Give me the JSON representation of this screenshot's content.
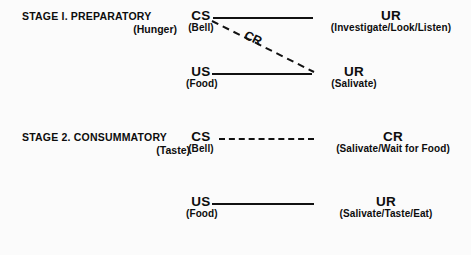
{
  "figure": {
    "background_color": "#fbfbfb",
    "ink_color": "#111111"
  },
  "stages": [
    {
      "id": "stage-1",
      "heading": "STAGE I.  PREPARATORY",
      "subheading": "(Hunger)",
      "rows": [
        {
          "id": "stage-1-row-1",
          "left_code": "CS",
          "left_paren": "(Bell)",
          "connector": "solid",
          "right_code": "UR",
          "right_paren": "(Investigate/Look/Listen)"
        },
        {
          "id": "stage-1-row-2",
          "left_code": "US",
          "left_paren": "(Food)",
          "connector": "solid",
          "right_code": "UR",
          "right_paren": "(Salivate)"
        }
      ],
      "diagonal": {
        "label": "CR",
        "style": "dashed",
        "from": "CS (Bell)",
        "to": "UR (Salivate)"
      }
    },
    {
      "id": "stage-2",
      "heading": "STAGE 2.  CONSUMMATORY",
      "subheading": "(Taste)",
      "rows": [
        {
          "id": "stage-2-row-1",
          "left_code": "CS",
          "left_paren": "(Bell)",
          "connector": "dashed",
          "right_code": "CR",
          "right_paren": "(Salivate/Wait for Food)"
        },
        {
          "id": "stage-2-row-2",
          "left_code": "US",
          "left_paren": "(Food)",
          "connector": "solid",
          "right_code": "UR",
          "right_paren": "(Salivate/Taste/Eat)"
        }
      ]
    }
  ]
}
